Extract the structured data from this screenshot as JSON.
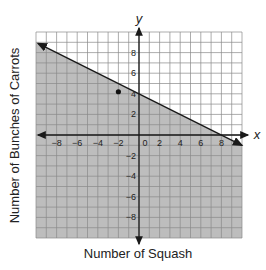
{
  "chart_data": {
    "type": "line",
    "title": "",
    "xlabel": "Number of Squash",
    "ylabel": "Number of Bunches of Carrots",
    "x_axis_label": "x",
    "y_axis_label": "y",
    "xlim": [
      -10,
      10
    ],
    "ylim": [
      -10,
      10
    ],
    "grid": true,
    "x_ticks": [
      -8,
      -6,
      -4,
      -2,
      0,
      2,
      4,
      6,
      8
    ],
    "y_ticks": [
      -8,
      -6,
      -4,
      -2,
      2,
      4,
      6,
      8
    ],
    "series": [
      {
        "name": "boundary line",
        "equation": "y = -0.5x + 4",
        "x": [
          -10,
          10
        ],
        "y": [
          9,
          -1
        ],
        "style": "solid",
        "arrows": "both"
      }
    ],
    "shaded_region": "below line (y <= -0.5x + 4)",
    "points": [
      {
        "x": -2,
        "y": 4.2,
        "label": ""
      }
    ]
  },
  "colors": {
    "shade": "#bdbdbd",
    "grid": "#8a8a8a",
    "axis": "#1a1a1a",
    "line": "#1a1a1a"
  }
}
